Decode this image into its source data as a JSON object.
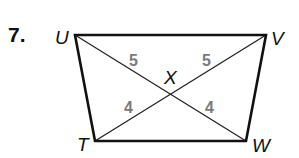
{
  "problem": {
    "number": "7."
  },
  "figure": {
    "type": "quadrilateral-with-diagonals",
    "vertices": [
      "U",
      "V",
      "W",
      "T"
    ],
    "intersection": "X",
    "diagonals": [
      "UW",
      "VT"
    ],
    "segments": [
      {
        "name": "UX",
        "label": "5"
      },
      {
        "name": "VX",
        "label": "5"
      },
      {
        "name": "TX",
        "label": "4"
      },
      {
        "name": "WX",
        "label": "4"
      }
    ]
  },
  "labels": {
    "U": "U",
    "V": "V",
    "W": "W",
    "T": "T",
    "X": "X"
  },
  "colors": {
    "line": "#111111",
    "segment_label": "#7a7a7a"
  }
}
